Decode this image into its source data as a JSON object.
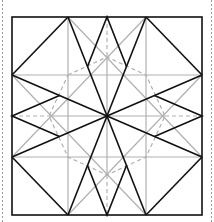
{
  "diagram": {
    "type": "crease-pattern",
    "colors": {
      "background": "#ffffff",
      "mountain": "#111111",
      "valley": "#b0b0b0",
      "dashed": "#b0b0b0",
      "border_dashed": "#9a9a9a"
    },
    "square": {
      "x1": 12,
      "y1": 17,
      "x2": 202,
      "y2": 215
    },
    "center": [
      107,
      116
    ],
    "octagon_points": [
      [
        68,
        17
      ],
      [
        146,
        17
      ],
      [
        202,
        75
      ],
      [
        202,
        157
      ],
      [
        146,
        215
      ],
      [
        68,
        215
      ],
      [
        12,
        157
      ],
      [
        12,
        75
      ]
    ],
    "edge_midpoints": [
      [
        107,
        17
      ],
      [
        202,
        116
      ],
      [
        107,
        215
      ],
      [
        12,
        116
      ]
    ],
    "inner_square": {
      "x1": 68,
      "y1": 75,
      "x2": 146,
      "y2": 157
    }
  }
}
